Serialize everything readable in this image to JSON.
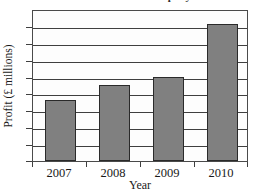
{
  "chart_data": {
    "type": "bar",
    "title": "Profit of the company",
    "xlabel": "Year",
    "ylabel": "Profit (£ millions)",
    "categories": [
      "2007",
      "2008",
      "2009",
      "2010"
    ],
    "values": [
      4,
      5,
      5.5,
      9
    ],
    "ylim": [
      0,
      10
    ],
    "y_tick_labels": [],
    "y_gridline_count": 8,
    "grid": true,
    "legend": false,
    "bar_fill_color": "#808080",
    "bar_edge_color": "#2a2a2a",
    "axis_color": "#3f3f3f",
    "background_color": "#ffffff"
  }
}
